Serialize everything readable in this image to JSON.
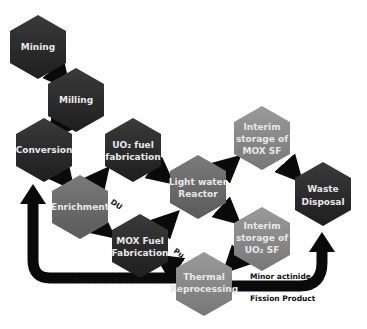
{
  "diagram": {
    "colors": {
      "dark_node": "#2b2b2b",
      "mid_node": "#6e6e6e",
      "light_node": "#8a8a8a",
      "arrow": "#0a0a0a",
      "label_text": "#e8e8e8",
      "edge_text": "#111111"
    },
    "nodes": [
      {
        "id": "mining",
        "lines": [
          "Mining"
        ],
        "shade": "dark"
      },
      {
        "id": "milling",
        "lines": [
          "Milling"
        ],
        "shade": "dark"
      },
      {
        "id": "conversion",
        "lines": [
          "Conversion"
        ],
        "shade": "dark"
      },
      {
        "id": "uo2_fab",
        "lines": [
          "UO₂ fuel",
          "fabrication"
        ],
        "shade": "dark"
      },
      {
        "id": "enrichment",
        "lines": [
          "Enrichment"
        ],
        "shade": "light"
      },
      {
        "id": "mox_fab",
        "lines": [
          "MOX Fuel",
          "Fabrication"
        ],
        "shade": "dark"
      },
      {
        "id": "lwr",
        "lines": [
          "Light water",
          "Reactor"
        ],
        "shade": "mid"
      },
      {
        "id": "interim_mox",
        "lines": [
          "Interim",
          "storage of",
          "MOX SF"
        ],
        "shade": "light"
      },
      {
        "id": "waste",
        "lines": [
          "Waste",
          "Disposal"
        ],
        "shade": "dark"
      },
      {
        "id": "interim_uo2",
        "lines": [
          "Interim",
          "storage of",
          "UO₂ SF"
        ],
        "shade": "light"
      },
      {
        "id": "reprocessing",
        "lines": [
          "Thermal",
          "Reprocessing"
        ],
        "shade": "light"
      }
    ],
    "edge_labels": {
      "du": "DU",
      "pu": "Pu",
      "recovered_uranium": "Recovered Uranium",
      "minor_actinide": "Minor actinide",
      "fission_product": "Fission Product"
    }
  }
}
